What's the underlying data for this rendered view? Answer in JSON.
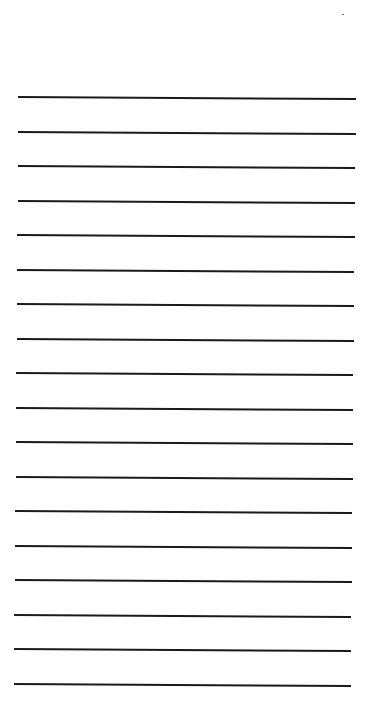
{
  "document": {
    "type": "lined-paper",
    "background_color": "#ffffff",
    "line_color": "#1a1a1a",
    "line_count": 18,
    "lines": [
      {
        "y": 96,
        "x1": 18,
        "x2": 356
      },
      {
        "y": 131,
        "x1": 18,
        "x2": 356
      },
      {
        "y": 165,
        "x1": 18,
        "x2": 355
      },
      {
        "y": 200,
        "x1": 18,
        "x2": 355
      },
      {
        "y": 234,
        "x1": 17,
        "x2": 355
      },
      {
        "y": 269,
        "x1": 17,
        "x2": 354
      },
      {
        "y": 303,
        "x1": 17,
        "x2": 354
      },
      {
        "y": 338,
        "x1": 17,
        "x2": 354
      },
      {
        "y": 372,
        "x1": 16,
        "x2": 353
      },
      {
        "y": 407,
        "x1": 16,
        "x2": 353
      },
      {
        "y": 441,
        "x1": 16,
        "x2": 353
      },
      {
        "y": 476,
        "x1": 16,
        "x2": 353
      },
      {
        "y": 510,
        "x1": 15,
        "x2": 352
      },
      {
        "y": 545,
        "x1": 15,
        "x2": 352
      },
      {
        "y": 579,
        "x1": 15,
        "x2": 352
      },
      {
        "y": 614,
        "x1": 14,
        "x2": 351
      },
      {
        "y": 648,
        "x1": 14,
        "x2": 351
      },
      {
        "y": 683,
        "x1": 14,
        "x2": 351
      }
    ]
  }
}
